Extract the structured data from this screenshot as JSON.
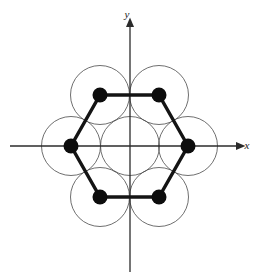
{
  "figure": {
    "background_color": "#ffffff"
  },
  "axes": {
    "x_axis": {
      "label": "x",
      "label_x": 247,
      "label_y": 149,
      "start_x": 10,
      "end_x": 237,
      "y": 146,
      "color": "#2b2b2b",
      "arrow": "right"
    },
    "y_axis": {
      "label": "y",
      "label_x": 127,
      "label_y": 18,
      "top_y": 26,
      "bottom_y": 272,
      "x": 130,
      "color": "#2b2b2b",
      "arrow": "up"
    },
    "origin": {
      "x": 130,
      "y": 146
    }
  },
  "circles": {
    "radius": 29.5,
    "stroke_color": "#4a4a4a",
    "stroke_width": 0.8,
    "fill": "none",
    "centers": [
      {
        "name": "center-circle",
        "x": 130,
        "y": 146
      },
      {
        "name": "circle-right",
        "x": 188,
        "y": 146
      },
      {
        "name": "circle-upper-right",
        "x": 159,
        "y": 95
      },
      {
        "name": "circle-upper-left",
        "x": 100,
        "y": 95
      },
      {
        "name": "circle-left",
        "x": 71,
        "y": 146
      },
      {
        "name": "circle-lower-left",
        "x": 100,
        "y": 197
      },
      {
        "name": "circle-lower-right",
        "x": 159,
        "y": 197
      }
    ]
  },
  "hexagon": {
    "stroke_color": "#141414",
    "stroke_width": 3.4,
    "fill": "none",
    "points": "188,146 159,95 100,95 71,146 100,197 159,197",
    "vertices": [
      {
        "name": "vertex-right",
        "x": 188,
        "y": 146
      },
      {
        "name": "vertex-upper-right",
        "x": 159,
        "y": 95
      },
      {
        "name": "vertex-upper-left",
        "x": 100,
        "y": 95
      },
      {
        "name": "vertex-left",
        "x": 71,
        "y": 146
      },
      {
        "name": "vertex-lower-left",
        "x": 100,
        "y": 197
      },
      {
        "name": "vertex-lower-right",
        "x": 159,
        "y": 197
      }
    ],
    "vertex_dot_radius": 7.5,
    "vertex_dot_color": "#0d0d0d"
  }
}
